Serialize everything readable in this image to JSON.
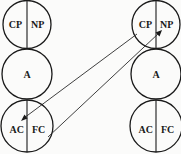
{
  "diagram": {
    "left_column": {
      "top": {
        "left_label": "CP",
        "right_label": "NP"
      },
      "middle": {
        "label": "A"
      },
      "bottom": {
        "left_label": "AC",
        "right_label": "FC"
      }
    },
    "right_column": {
      "top": {
        "left_label": "CP",
        "right_label": "NP"
      },
      "middle": {
        "label": "A"
      },
      "bottom": {
        "left_label": "AC",
        "right_label": "FC"
      }
    },
    "connections": [
      {
        "from": "right_column.top.CP",
        "to": "left_column.bottom.AC",
        "arrow": "end"
      },
      {
        "from": "left_column.bottom.FC",
        "to": "right_column.top.NP",
        "arrow": "end"
      }
    ]
  }
}
